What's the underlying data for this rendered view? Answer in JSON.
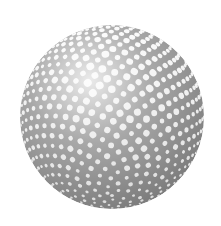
{
  "image": {
    "subject": "textured sphere with honeycomb dimple lattice",
    "width": 221,
    "height": 226,
    "background_color": "#ffffff"
  },
  "sphere": {
    "cx": 112,
    "cy": 117,
    "r": 92,
    "base_color": "#7a7a7a",
    "dark_color": "#6e6e6e",
    "highlight_color": "#ffffff",
    "light_direction": "top-left"
  }
}
